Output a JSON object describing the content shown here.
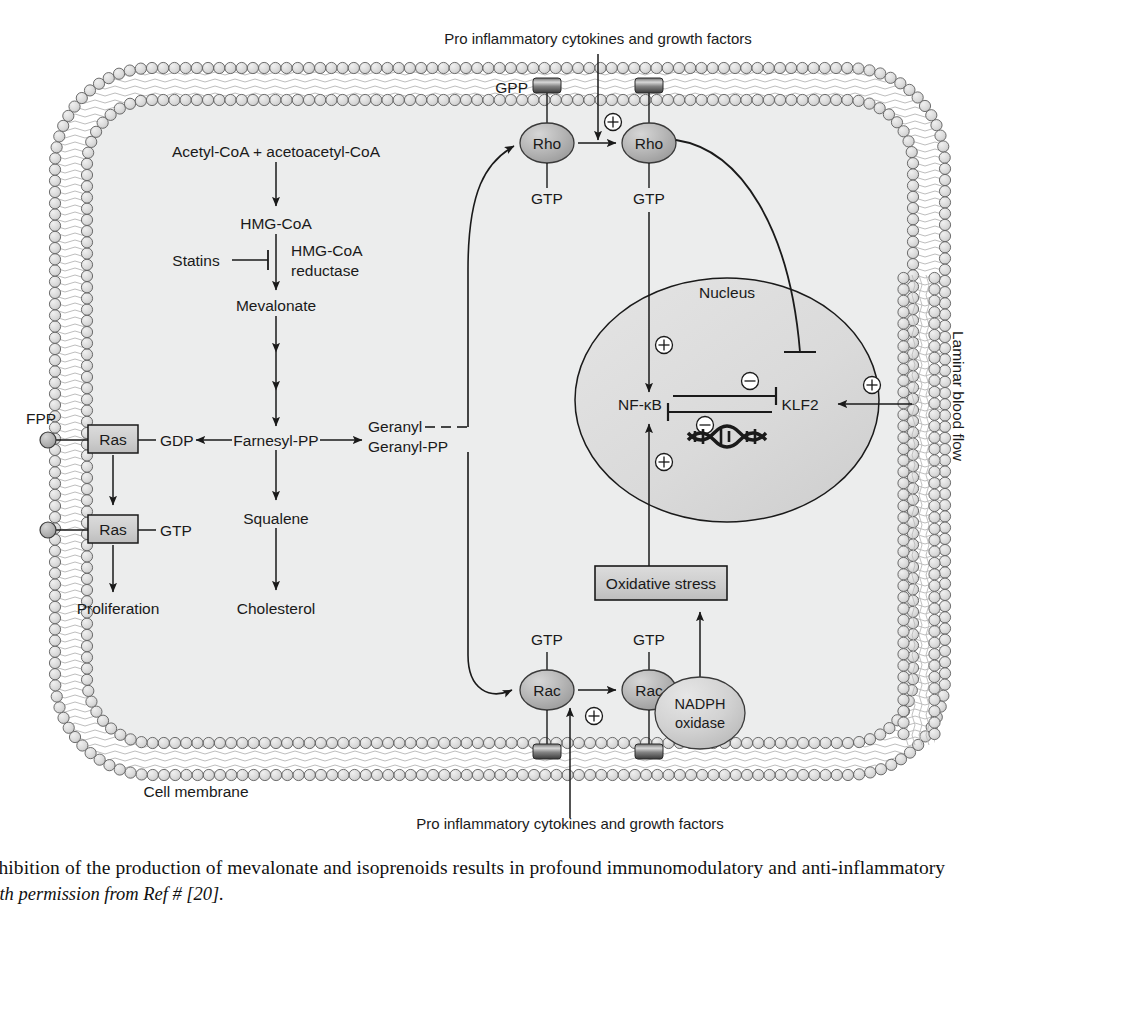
{
  "figure": {
    "type": "biological-pathway-diagram",
    "caption_line1": "Inhibition of the production of mevalonate and isoprenoids results in profound immunomodulatory and anti-inflammatory",
    "caption_line2": "with permission from Ref # [20]."
  },
  "cell": {
    "membrane_label": "Cell membrane",
    "nucleus_label": "Nucleus",
    "laminar_flow_label": "Laminar blood flow"
  },
  "stimuli": {
    "top": "Pro inflammatory cytokines and growth factors",
    "bottom": "Pro inflammatory cytokines and growth factors"
  },
  "mevalonate_pathway": {
    "steps": [
      "Acetyl-CoA + acetoacetyl-CoA",
      "HMG-CoA",
      "Mevalonate",
      "Farnesyl-PP",
      "Squalene",
      "Cholesterol"
    ],
    "enzyme_line1": "HMG-CoA",
    "enzyme_line2": "reductase",
    "inhibitor": "Statins"
  },
  "isoprenoids": {
    "geranyl_line1": "Geranyl",
    "geranyl_line2": "Geranyl-PP",
    "farnesyl_anchor": "FPP",
    "geranyl_anchor": "GPP"
  },
  "ras_branch": {
    "node1": "Ras",
    "node1_nucleotide": "GDP",
    "node2": "Ras",
    "node2_nucleotide": "GTP",
    "outcome": "Proliferation"
  },
  "rho_branch": {
    "node1": "Rho",
    "node1_nucleotide": "GTP",
    "node2": "Rho",
    "node2_nucleotide": "GTP"
  },
  "rac_branch": {
    "node1": "Rac",
    "node1_nucleotide": "GTP",
    "node2": "Rac",
    "node2_nucleotide": "GTP",
    "enzyme_line1": "NADPH",
    "enzyme_line2": "oxidase",
    "product": "Oxidative stress"
  },
  "nucleus_factors": {
    "nfkb": "NF-κB",
    "klf2": "KLF2"
  },
  "signs": {
    "plus": "⊕",
    "minus": "⊖"
  },
  "colors": {
    "cytosol": "#eceded",
    "nucleus": "#dcdcdc",
    "gtpase_fill": "#b9b9b9",
    "nadph_fill": "#d3d3d3",
    "box_fill": "#cfcfcf",
    "membrane_head": "#d8d8d8",
    "stroke": "#1a1a1a"
  },
  "chart_data": {
    "type": "diagram",
    "nodes": [
      {
        "id": "acetyl",
        "label": "Acetyl-CoA + acetoacetyl-CoA",
        "x": 276,
        "y": 152,
        "shape": "text"
      },
      {
        "id": "hmgcoa",
        "label": "HMG-CoA",
        "x": 276,
        "y": 224,
        "shape": "text"
      },
      {
        "id": "mevalonate",
        "label": "Mevalonate",
        "x": 276,
        "y": 306,
        "shape": "text"
      },
      {
        "id": "farnesylpp",
        "label": "Farnesyl-PP",
        "x": 276,
        "y": 440,
        "shape": "text"
      },
      {
        "id": "squalene",
        "label": "Squalene",
        "x": 276,
        "y": 518,
        "shape": "text"
      },
      {
        "id": "cholesterol",
        "label": "Cholesterol",
        "x": 276,
        "y": 608,
        "shape": "text"
      },
      {
        "id": "statins",
        "label": "Statins",
        "x": 196,
        "y": 260,
        "shape": "text"
      },
      {
        "id": "reductase",
        "label": "HMG-CoA reductase",
        "x": 322,
        "y": 260,
        "shape": "text"
      },
      {
        "id": "geranyl",
        "label": "Geranyl Geranyl-PP",
        "x": 412,
        "y": 440,
        "shape": "text"
      },
      {
        "id": "gdp",
        "label": "GDP",
        "x": 166,
        "y": 440,
        "shape": "text"
      },
      {
        "id": "ras1",
        "label": "Ras",
        "x": 112,
        "y": 438,
        "shape": "box"
      },
      {
        "id": "ras2",
        "label": "Ras",
        "x": 112,
        "y": 528,
        "shape": "box"
      },
      {
        "id": "gtp_ras2",
        "label": "GTP",
        "x": 166,
        "y": 528,
        "shape": "text"
      },
      {
        "id": "proliferation",
        "label": "Proliferation",
        "x": 118,
        "y": 608,
        "shape": "text"
      },
      {
        "id": "fpp",
        "label": "FPP",
        "x": 42,
        "y": 420,
        "shape": "text"
      },
      {
        "id": "gpp",
        "label": "GPP",
        "x": 512,
        "y": 90,
        "shape": "text"
      },
      {
        "id": "rho1",
        "label": "Rho",
        "x": 546,
        "y": 143,
        "shape": "ellipse"
      },
      {
        "id": "rho2",
        "label": "Rho",
        "x": 648,
        "y": 143,
        "shape": "ellipse"
      },
      {
        "id": "rac1",
        "label": "Rac",
        "x": 546,
        "y": 690,
        "shape": "ellipse"
      },
      {
        "id": "rac2",
        "label": "Rac",
        "x": 648,
        "y": 690,
        "shape": "ellipse"
      },
      {
        "id": "nadph",
        "label": "NADPH oxidase",
        "x": 700,
        "y": 712,
        "shape": "ellipse"
      },
      {
        "id": "oxstress",
        "label": "Oxidative stress",
        "x": 661,
        "y": 584,
        "shape": "box"
      },
      {
        "id": "nfkb",
        "label": "NF-κB",
        "x": 640,
        "y": 404,
        "shape": "text"
      },
      {
        "id": "klf2",
        "label": "KLF2",
        "x": 800,
        "y": 404,
        "shape": "text"
      },
      {
        "id": "nucleus",
        "label": "Nucleus",
        "x": 727,
        "y": 293,
        "shape": "ellipse"
      }
    ],
    "edges": [
      {
        "from": "acetyl",
        "to": "hmgcoa",
        "kind": "arrow"
      },
      {
        "from": "hmgcoa",
        "to": "mevalonate",
        "kind": "arrow"
      },
      {
        "from": "mevalonate",
        "to": "farnesylpp",
        "kind": "arrow-multi"
      },
      {
        "from": "statins",
        "to": "reductase",
        "kind": "inhibit"
      },
      {
        "from": "farnesylpp",
        "to": "gdp",
        "kind": "arrow"
      },
      {
        "from": "farnesylpp",
        "to": "geranyl",
        "kind": "arrow"
      },
      {
        "from": "farnesylpp",
        "to": "squalene",
        "kind": "arrow"
      },
      {
        "from": "squalene",
        "to": "cholesterol",
        "kind": "arrow"
      },
      {
        "from": "ras1",
        "to": "ras2",
        "kind": "arrow"
      },
      {
        "from": "ras2",
        "to": "proliferation",
        "kind": "arrow"
      },
      {
        "from": "geranyl",
        "to": "rho1",
        "kind": "curve-arrow"
      },
      {
        "from": "geranyl",
        "to": "rac1",
        "kind": "curve-arrow"
      },
      {
        "from": "rho1",
        "to": "rho2",
        "kind": "arrow"
      },
      {
        "from": "rac1",
        "to": "rac2",
        "kind": "arrow"
      },
      {
        "from": "stimuli_top",
        "to": "rho2",
        "kind": "arrow",
        "sign": "plus"
      },
      {
        "from": "stimuli_bottom",
        "to": "rac2",
        "kind": "arrow",
        "sign": "plus"
      },
      {
        "from": "rho2",
        "to": "nfkb",
        "kind": "arrow",
        "sign": "plus"
      },
      {
        "from": "rho2",
        "to": "klf2",
        "kind": "inhibit-curve"
      },
      {
        "from": "nadph",
        "to": "oxstress",
        "kind": "arrow"
      },
      {
        "from": "oxstress",
        "to": "nfkb",
        "kind": "arrow",
        "sign": "plus"
      },
      {
        "from": "klf2",
        "to": "nfkb",
        "kind": "inhibit",
        "sign": "minus"
      },
      {
        "from": "nfkb",
        "to": "klf2",
        "kind": "inhibit",
        "sign": "minus"
      },
      {
        "from": "laminar_flow",
        "to": "klf2",
        "kind": "arrow",
        "sign": "plus"
      }
    ]
  }
}
